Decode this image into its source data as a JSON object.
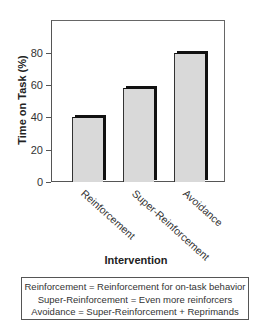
{
  "chart_data": {
    "type": "bar",
    "title": "",
    "xlabel": "Intervention",
    "ylabel": "Time on Task (%)",
    "categories": [
      "Reinforcement",
      "Super-Reinforcement",
      "Avoidance"
    ],
    "values": [
      40,
      58,
      80
    ],
    "ylim": [
      0,
      100
    ],
    "yticks": [
      0,
      20,
      40,
      60,
      80
    ],
    "grid": false,
    "legend_position": "bottom (text box)",
    "bar_color": "#d9d9d9",
    "bar_shadow_color": "#111111"
  },
  "axes": {
    "y_title": "Time on Task (%)",
    "x_title": "Intervention",
    "y_ticks": [
      {
        "label": "0",
        "value": 0
      },
      {
        "label": "20",
        "value": 20
      },
      {
        "label": "40",
        "value": 40
      },
      {
        "label": "60",
        "value": 60
      },
      {
        "label": "80",
        "value": 80
      }
    ]
  },
  "bars": [
    {
      "label": "Reinforcement",
      "value": 40
    },
    {
      "label": "Super-Reinforcement",
      "value": 58
    },
    {
      "label": "Avoidance",
      "value": 80
    }
  ],
  "legend": {
    "lines": [
      "Reinforcement = Reinforcement for on-task behavior",
      "Super-Reinforcement = Even more reinforcers",
      "Avoidance = Super-Reinforcement + Reprimands"
    ]
  }
}
